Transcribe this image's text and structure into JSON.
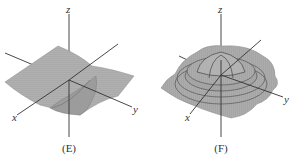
{
  "figure": {
    "panels": [
      {
        "id": "E",
        "caption": "(E)",
        "axes": {
          "x": "x",
          "y": "y",
          "z": "z"
        },
        "surface": "saddle-like sheet with a downward fold near origin"
      },
      {
        "id": "F",
        "caption": "(F)",
        "axes": {
          "x": "x",
          "y": "y",
          "z": "z"
        },
        "surface": "radially symmetric ripple (central dome with concentric rings)"
      }
    ],
    "colors": {
      "surface_fill": "#a8a8a8",
      "surface_mesh": "#8c8c8c",
      "axis_line": "#333333",
      "ridge_line": "#444444"
    }
  }
}
